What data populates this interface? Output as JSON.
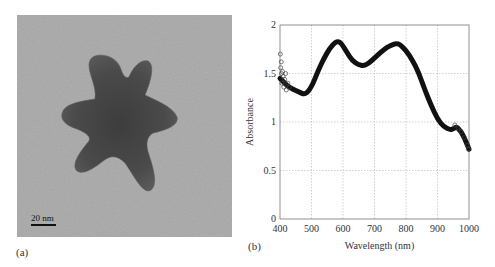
{
  "panels": {
    "a": {
      "label": "(a)",
      "scale_bar": "20 nm",
      "description": "TEM image of a star-shaped gold nanoparticle"
    },
    "b": {
      "label": "(b)"
    }
  },
  "chart_data": {
    "type": "scatter",
    "title": "",
    "xlabel": "Wavelength (nm)",
    "ylabel": "Absorbance",
    "xlim": [
      400,
      1000
    ],
    "ylim": [
      0,
      2
    ],
    "xticks": [
      400,
      500,
      600,
      700,
      800,
      900,
      1000
    ],
    "yticks": [
      0,
      0.5,
      1,
      1.5,
      2
    ],
    "ytick_labels": [
      "0",
      "0.5",
      "1",
      "1.5",
      "2"
    ],
    "grid": true,
    "legend": null,
    "marker": "open circle",
    "series": [
      {
        "name": "Absorbance",
        "x": [
          400,
          410,
          420,
          440,
          460,
          480,
          500,
          520,
          540,
          560,
          575,
          585,
          595,
          610,
          630,
          650,
          665,
          680,
          700,
          720,
          740,
          760,
          770,
          780,
          800,
          820,
          840,
          860,
          880,
          900,
          920,
          940,
          950,
          960,
          970,
          980,
          990,
          1000
        ],
        "values": [
          1.45,
          1.42,
          1.38,
          1.34,
          1.31,
          1.28,
          1.36,
          1.52,
          1.66,
          1.77,
          1.82,
          1.83,
          1.81,
          1.73,
          1.63,
          1.59,
          1.58,
          1.6,
          1.66,
          1.72,
          1.77,
          1.8,
          1.81,
          1.8,
          1.74,
          1.64,
          1.51,
          1.33,
          1.17,
          1.03,
          0.95,
          0.92,
          0.93,
          0.95,
          0.92,
          0.87,
          0.8,
          0.72
        ]
      }
    ],
    "annotations": [
      "noisy scatter near 400 nm ranging ~1.35–1.7"
    ]
  }
}
